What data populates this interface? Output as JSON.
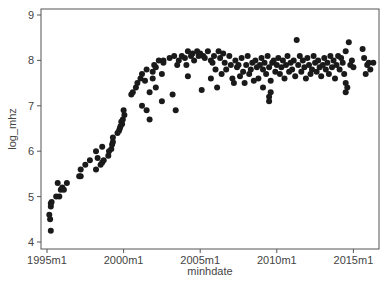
{
  "chart_data": {
    "type": "scatter",
    "title": "",
    "xlabel": "minhdate",
    "ylabel": "log_mhz",
    "xlim": [
      1994.6,
      2016.7
    ],
    "ylim": [
      3.85,
      9.1
    ],
    "grid": false,
    "legend": null,
    "x_ticks": [
      {
        "value": 1995.0,
        "label": "1995m1"
      },
      {
        "value": 2000.0,
        "label": "2000m1"
      },
      {
        "value": 2005.0,
        "label": "2005m1"
      },
      {
        "value": 2010.0,
        "label": "2010m1"
      },
      {
        "value": 2015.0,
        "label": "2015m1"
      }
    ],
    "y_ticks": [
      {
        "value": 4,
        "label": "4"
      },
      {
        "value": 5,
        "label": "5"
      },
      {
        "value": 6,
        "label": "6"
      },
      {
        "value": 7,
        "label": "7"
      },
      {
        "value": 8,
        "label": "8"
      },
      {
        "value": 9,
        "label": "9"
      }
    ],
    "marker_color": "#1a1a1a",
    "points": [
      [
        1995.25,
        4.25
      ],
      [
        1995.2,
        4.5
      ],
      [
        1995.15,
        4.6
      ],
      [
        1995.25,
        4.78
      ],
      [
        1995.25,
        4.85
      ],
      [
        1995.3,
        4.88
      ],
      [
        1995.6,
        5.0
      ],
      [
        1995.8,
        5.0
      ],
      [
        1995.7,
        5.3
      ],
      [
        1995.9,
        5.15
      ],
      [
        1996.0,
        5.2
      ],
      [
        1996.1,
        5.15
      ],
      [
        1996.3,
        5.3
      ],
      [
        1997.1,
        5.45
      ],
      [
        1997.2,
        5.45
      ],
      [
        1997.2,
        5.6
      ],
      [
        1997.5,
        5.7
      ],
      [
        1997.8,
        5.8
      ],
      [
        1998.2,
        5.6
      ],
      [
        1998.3,
        5.85
      ],
      [
        1998.2,
        6.0
      ],
      [
        1998.5,
        5.7
      ],
      [
        1998.6,
        5.75
      ],
      [
        1998.7,
        5.8
      ],
      [
        1998.6,
        6.1
      ],
      [
        1999.0,
        5.9
      ],
      [
        1999.05,
        6.0
      ],
      [
        1999.2,
        6.05
      ],
      [
        1999.25,
        6.15
      ],
      [
        1999.3,
        6.2
      ],
      [
        1999.3,
        6.3
      ],
      [
        1999.6,
        6.4
      ],
      [
        1999.7,
        6.45
      ],
      [
        1999.75,
        6.5
      ],
      [
        1999.8,
        6.55
      ],
      [
        1999.85,
        6.65
      ],
      [
        1999.9,
        6.6
      ],
      [
        1999.95,
        6.7
      ],
      [
        2000.0,
        6.9
      ],
      [
        2000.05,
        6.8
      ],
      [
        2000.5,
        7.25
      ],
      [
        2000.6,
        7.3
      ],
      [
        2000.8,
        7.4
      ],
      [
        2000.9,
        7.5
      ],
      [
        2001.1,
        7.6
      ],
      [
        2001.2,
        7.7
      ],
      [
        2001.2,
        7.0
      ],
      [
        2001.4,
        7.55
      ],
      [
        2001.5,
        7.8
      ],
      [
        2001.5,
        6.9
      ],
      [
        2001.7,
        6.7
      ],
      [
        2001.7,
        7.3
      ],
      [
        2001.9,
        7.75
      ],
      [
        2001.9,
        7.6
      ],
      [
        2002.0,
        7.9
      ],
      [
        2002.1,
        7.85
      ],
      [
        2002.1,
        7.4
      ],
      [
        2002.3,
        8.0
      ],
      [
        2002.5,
        7.7
      ],
      [
        2002.5,
        7.1
      ],
      [
        2002.6,
        8.0
      ],
      [
        2002.6,
        7.95
      ],
      [
        2003.0,
        8.05
      ],
      [
        2003.2,
        7.25
      ],
      [
        2003.3,
        8.1
      ],
      [
        2003.4,
        6.9
      ],
      [
        2003.5,
        7.9
      ],
      [
        2003.6,
        8.0
      ],
      [
        2003.8,
        8.1
      ],
      [
        2004.0,
        8.05
      ],
      [
        2004.1,
        7.9
      ],
      [
        2004.2,
        7.65
      ],
      [
        2004.2,
        8.2
      ],
      [
        2004.4,
        8.1
      ],
      [
        2004.5,
        8.15
      ],
      [
        2004.6,
        8.0
      ],
      [
        2004.8,
        8.2
      ],
      [
        2004.9,
        8.1
      ],
      [
        2005.0,
        8.15
      ],
      [
        2005.1,
        7.35
      ],
      [
        2005.2,
        8.1
      ],
      [
        2005.3,
        8.05
      ],
      [
        2005.5,
        8.2
      ],
      [
        2005.7,
        7.6
      ],
      [
        2005.7,
        8.0
      ],
      [
        2005.8,
        7.95
      ],
      [
        2005.9,
        8.1
      ],
      [
        2006.0,
        7.8
      ],
      [
        2006.1,
        7.4
      ],
      [
        2006.2,
        8.2
      ],
      [
        2006.3,
        8.05
      ],
      [
        2006.4,
        7.7
      ],
      [
        2006.5,
        8.15
      ],
      [
        2006.6,
        7.95
      ],
      [
        2006.7,
        7.8
      ],
      [
        2006.9,
        8.1
      ],
      [
        2007.0,
        7.9
      ],
      [
        2007.1,
        7.6
      ],
      [
        2007.2,
        7.5
      ],
      [
        2007.3,
        8.0
      ],
      [
        2007.4,
        7.85
      ],
      [
        2007.5,
        7.9
      ],
      [
        2007.6,
        7.65
      ],
      [
        2007.7,
        8.05
      ],
      [
        2007.8,
        7.75
      ],
      [
        2007.9,
        7.5
      ],
      [
        2008.0,
        7.9
      ],
      [
        2008.1,
        8.1
      ],
      [
        2008.2,
        7.7
      ],
      [
        2008.3,
        7.8
      ],
      [
        2008.4,
        7.95
      ],
      [
        2008.5,
        7.55
      ],
      [
        2008.6,
        8.0
      ],
      [
        2008.7,
        7.85
      ],
      [
        2008.8,
        7.6
      ],
      [
        2008.9,
        7.9
      ],
      [
        2009.0,
        8.05
      ],
      [
        2009.1,
        7.8
      ],
      [
        2009.1,
        7.4
      ],
      [
        2009.2,
        7.95
      ],
      [
        2009.3,
        7.7
      ],
      [
        2009.4,
        8.1
      ],
      [
        2009.5,
        7.85
      ],
      [
        2009.6,
        7.55
      ],
      [
        2009.5,
        7.1
      ],
      [
        2009.5,
        7.2
      ],
      [
        2009.6,
        7.3
      ],
      [
        2009.7,
        7.95
      ],
      [
        2009.8,
        8.0
      ],
      [
        2009.9,
        7.75
      ],
      [
        2010.0,
        7.9
      ],
      [
        2010.1,
        8.05
      ],
      [
        2010.2,
        7.7
      ],
      [
        2010.3,
        7.85
      ],
      [
        2010.4,
        8.0
      ],
      [
        2010.5,
        7.6
      ],
      [
        2010.6,
        7.9
      ],
      [
        2010.7,
        8.1
      ],
      [
        2010.8,
        7.75
      ],
      [
        2010.9,
        7.95
      ],
      [
        2011.0,
        7.8
      ],
      [
        2011.1,
        8.0
      ],
      [
        2011.2,
        7.65
      ],
      [
        2011.3,
        8.45
      ],
      [
        2011.4,
        7.9
      ],
      [
        2011.5,
        8.1
      ],
      [
        2011.6,
        7.75
      ],
      [
        2011.7,
        8.0
      ],
      [
        2011.8,
        7.85
      ],
      [
        2011.9,
        7.6
      ],
      [
        2012.0,
        8.05
      ],
      [
        2012.1,
        7.9
      ],
      [
        2012.2,
        7.7
      ],
      [
        2012.3,
        7.8
      ],
      [
        2012.4,
        8.1
      ],
      [
        2012.5,
        7.95
      ],
      [
        2012.6,
        7.75
      ],
      [
        2012.7,
        8.0
      ],
      [
        2012.8,
        7.85
      ],
      [
        2012.9,
        7.65
      ],
      [
        2013.0,
        7.9
      ],
      [
        2013.1,
        8.05
      ],
      [
        2013.2,
        7.8
      ],
      [
        2013.3,
        7.95
      ],
      [
        2013.4,
        7.7
      ],
      [
        2013.5,
        8.1
      ],
      [
        2013.6,
        7.85
      ],
      [
        2013.7,
        8.0
      ],
      [
        2013.8,
        7.6
      ],
      [
        2013.9,
        7.9
      ],
      [
        2014.0,
        8.1
      ],
      [
        2014.1,
        7.8
      ],
      [
        2014.2,
        8.05
      ],
      [
        2014.3,
        7.95
      ],
      [
        2014.4,
        7.7
      ],
      [
        2014.5,
        8.2
      ],
      [
        2014.5,
        7.5
      ],
      [
        2014.5,
        7.3
      ],
      [
        2014.6,
        7.4
      ],
      [
        2014.7,
        8.4
      ],
      [
        2014.8,
        7.9
      ],
      [
        2014.9,
        8.0
      ],
      [
        2015.0,
        7.85
      ],
      [
        2015.6,
        8.25
      ],
      [
        2015.7,
        8.05
      ],
      [
        2015.8,
        7.7
      ],
      [
        2015.9,
        7.9
      ],
      [
        2016.0,
        7.95
      ],
      [
        2016.1,
        7.8
      ],
      [
        2016.3,
        7.95
      ]
    ]
  }
}
